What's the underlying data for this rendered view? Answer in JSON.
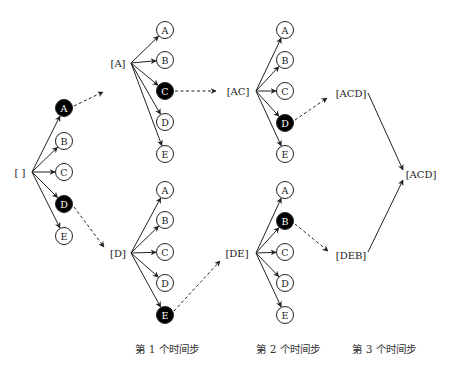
{
  "colors": {
    "selected_fill": "#000000",
    "selected_text": "#ffffff",
    "default_fill": "#ffffff",
    "line": "#222222"
  },
  "tokens": [
    "A",
    "B",
    "C",
    "D",
    "E"
  ],
  "states": [
    {
      "id": "root",
      "label": "[ ]",
      "x": 20,
      "y": 172
    },
    {
      "id": "A",
      "label": "[A]",
      "x": 118,
      "y": 63
    },
    {
      "id": "D",
      "label": "[D]",
      "x": 118,
      "y": 253
    },
    {
      "id": "AC",
      "label": "[AC]",
      "x": 238,
      "y": 91
    },
    {
      "id": "DE",
      "label": "[DE]",
      "x": 237,
      "y": 253
    },
    {
      "id": "ACD",
      "label": "[ACD]",
      "x": 351,
      "y": 93
    },
    {
      "id": "DEB",
      "label": "[DEB]",
      "x": 351,
      "y": 255
    },
    {
      "id": "final",
      "label": "[ACD]",
      "x": 421,
      "y": 174
    }
  ],
  "expansions": [
    {
      "from": "root",
      "x0": 32,
      "y0": 172,
      "cx": 64,
      "ys": [
        108,
        141,
        172,
        204,
        236
      ],
      "selected": [
        0,
        3
      ]
    },
    {
      "from": "A",
      "x0": 131,
      "y0": 63,
      "cx": 165,
      "ys": [
        30,
        60,
        91,
        122,
        154
      ],
      "selected": [
        2
      ]
    },
    {
      "from": "D",
      "x0": 131,
      "y0": 253,
      "cx": 165,
      "ys": [
        190,
        220,
        252,
        283,
        315
      ],
      "selected": [
        4
      ]
    },
    {
      "from": "AC",
      "x0": 256,
      "y0": 91,
      "cx": 285,
      "ys": [
        30,
        60,
        91,
        123,
        154
      ],
      "selected": [
        3
      ]
    },
    {
      "from": "DE",
      "x0": 256,
      "y0": 253,
      "cx": 285,
      "ys": [
        190,
        221,
        252,
        283,
        315
      ],
      "selected": [
        1
      ]
    }
  ],
  "dashed_links": [
    {
      "x1": 74,
      "y1": 106,
      "x2": 103,
      "y2": 92
    },
    {
      "x1": 74,
      "y1": 207,
      "x2": 104,
      "y2": 247
    },
    {
      "x1": 175,
      "y1": 91,
      "x2": 216,
      "y2": 91
    },
    {
      "x1": 174,
      "y1": 311,
      "x2": 220,
      "y2": 261
    },
    {
      "x1": 295,
      "y1": 120,
      "x2": 327,
      "y2": 98
    },
    {
      "x1": 295,
      "y1": 224,
      "x2": 328,
      "y2": 251
    }
  ],
  "solid_links": [
    {
      "x1": 368,
      "y1": 93,
      "x2": 403,
      "y2": 170
    },
    {
      "x1": 368,
      "y1": 252,
      "x2": 403,
      "y2": 180
    }
  ],
  "step_labels": [
    {
      "label": "第 1 个时间步",
      "x": 167,
      "y": 353
    },
    {
      "label": "第 2 个时间步",
      "x": 288,
      "y": 353
    },
    {
      "label": "第 3 个时间步",
      "x": 384,
      "y": 353
    }
  ]
}
